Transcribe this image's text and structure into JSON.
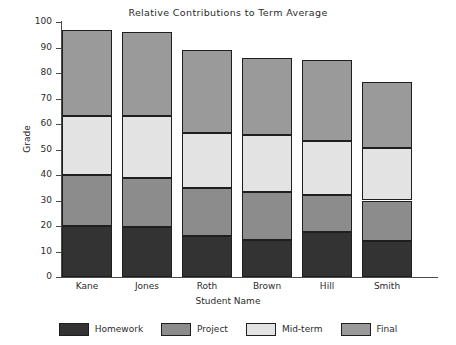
{
  "chart_data": {
    "type": "bar",
    "subtype": "stacked-bar-vertical",
    "title": "Relative Contributions to Term Average",
    "xlabel": "Student Name",
    "ylabel": "Grade",
    "categories": [
      "Kane",
      "Jones",
      "Roth",
      "Brown",
      "Hill",
      "Smith"
    ],
    "series": [
      {
        "name": "Homework",
        "color": "#333333",
        "values": [
          20,
          19.5,
          16,
          14.5,
          17.5,
          14
        ]
      },
      {
        "name": "Project",
        "color": "#8c8c8c",
        "values": [
          20,
          19.5,
          19,
          19,
          14.5,
          16
        ]
      },
      {
        "name": "Mid-term",
        "color": "#e3e3e3",
        "values": [
          23,
          24,
          21.5,
          22,
          21.5,
          20.5
        ]
      },
      {
        "name": "Final",
        "color": "#9a9a9a",
        "values": [
          34,
          33,
          32.5,
          30.5,
          31.5,
          26
        ]
      }
    ],
    "totals": [
      97,
      96,
      89,
      86,
      85,
      76.5
    ],
    "ylim": [
      0,
      100
    ],
    "yticks": [
      0,
      10,
      20,
      30,
      40,
      50,
      60,
      70,
      80,
      90,
      100
    ],
    "ytick_labels": [
      "0",
      "10",
      "20",
      "30",
      "40",
      "50",
      "60",
      "70",
      "80",
      "90",
      "100"
    ],
    "grid": false,
    "legend_position": "bottom",
    "legend_entries": [
      "Homework",
      "Project",
      "Mid-term",
      "Final"
    ]
  }
}
